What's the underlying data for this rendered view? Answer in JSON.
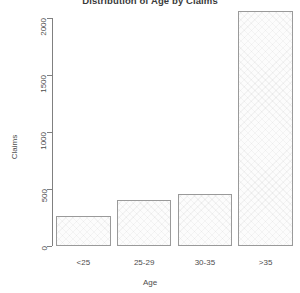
{
  "chart_data": {
    "type": "bar",
    "title": "Distribution of Age by Claims",
    "xlabel": "Age",
    "ylabel": "Claims",
    "categories": [
      "<25",
      "25-29",
      "30-35",
      ">35"
    ],
    "values": [
      263,
      403,
      456,
      2060
    ],
    "ylim": [
      0,
      2100
    ],
    "yticks": [
      0,
      500,
      1000,
      1500,
      2000
    ],
    "ytick_labels": [
      "0",
      "500",
      "1000",
      "1500",
      "2000"
    ],
    "grid": false,
    "legend": false,
    "bar_fill_color": "#fcfcfc",
    "bar_border_color": "#9a9a9a",
    "background_color": "#ffffff",
    "text_color": "#4d4d4d"
  }
}
